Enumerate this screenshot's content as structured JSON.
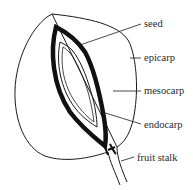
{
  "diagram": {
    "labels": [
      {
        "id": "seed",
        "text": "seed",
        "x": 144,
        "y": 20
      },
      {
        "id": "epicarp",
        "text": "epicarp",
        "x": 144,
        "y": 53
      },
      {
        "id": "mesocarp",
        "text": "mesocarp",
        "x": 144,
        "y": 86
      },
      {
        "id": "endocarp",
        "text": "endocarp",
        "x": 144,
        "y": 120
      },
      {
        "id": "fruit-stalk",
        "text": "fruit stalk",
        "x": 137,
        "y": 153
      }
    ],
    "colors": {
      "line": "#1a1a1a",
      "text": "#2a2a2a",
      "background": "#ffffff"
    }
  }
}
